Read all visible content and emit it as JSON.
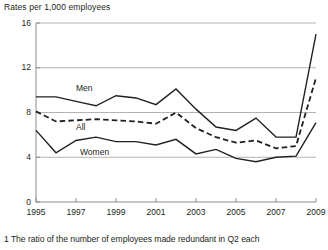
{
  "chart_data": {
    "type": "line",
    "title": "Rates per 1,000 employees",
    "ylabel": "Rates per 1,000 employees",
    "xlabel": "",
    "ylim": [
      0,
      16
    ],
    "yticks": [
      0,
      4,
      8,
      12,
      16
    ],
    "ytick_labels": [
      "0",
      "4",
      "8",
      "12",
      "16"
    ],
    "xlim": [
      1995,
      2009
    ],
    "x": [
      1995,
      1996,
      1997,
      1998,
      1999,
      2000,
      2001,
      2002,
      2003,
      2004,
      2005,
      2006,
      2007,
      2008,
      2009
    ],
    "xticks": [
      1995,
      1997,
      1999,
      2001,
      2003,
      2005,
      2007,
      2009
    ],
    "xtick_labels": [
      "1995",
      "1997",
      "1999",
      "2001",
      "2003",
      "2005",
      "2007",
      "2009"
    ],
    "grid": true,
    "grid_axis": "y",
    "legend": "inline-annotations",
    "series": [
      {
        "name": "Men",
        "style": "solid",
        "color": "#231f20",
        "values": [
          9.4,
          9.4,
          9.0,
          8.6,
          9.5,
          9.3,
          8.7,
          10.1,
          8.3,
          6.7,
          6.4,
          7.5,
          5.8,
          5.8,
          15.0
        ]
      },
      {
        "name": "All",
        "style": "dashed",
        "color": "#231f20",
        "values": [
          8.1,
          7.2,
          7.3,
          7.4,
          7.3,
          7.2,
          7.0,
          8.0,
          6.6,
          5.8,
          5.3,
          5.5,
          4.8,
          5.0,
          11.1
        ]
      },
      {
        "name": "Women",
        "style": "solid",
        "color": "#231f20",
        "values": [
          6.4,
          4.4,
          5.5,
          5.8,
          5.4,
          5.4,
          5.1,
          5.6,
          4.3,
          4.7,
          3.9,
          3.6,
          4.0,
          4.1,
          7.1
        ]
      }
    ],
    "annotations": [
      {
        "text": "Men",
        "x": 1997.0,
        "y": 10.1
      },
      {
        "text": "All",
        "x": 1997.0,
        "y": 6.6
      },
      {
        "text": "Women",
        "x": 1997.2,
        "y": 4.4
      }
    ]
  },
  "footnote": {
    "marker": "1",
    "text": "The ratio of the number of employees made redundant in Q2 each",
    "full": "1  The ratio of the number of employees made redundant in Q2 each"
  },
  "colors": {
    "ink": "#231f20",
    "grid": "#b3b3b3",
    "axis": "#8c8c8c",
    "background": "#ffffff"
  }
}
